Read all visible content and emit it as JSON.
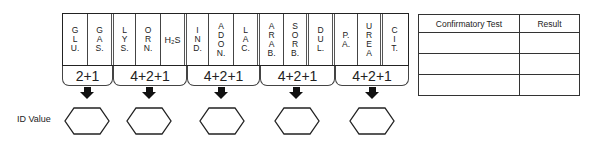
{
  "strip": {
    "cells": [
      {
        "label": [
          "G",
          "L",
          "U."
        ]
      },
      {
        "label": [
          "G",
          "A",
          "S."
        ]
      },
      {
        "label": [
          "L",
          "Y",
          "S."
        ]
      },
      {
        "label": [
          "O",
          "R",
          "N."
        ]
      },
      {
        "label": "H₂S"
      },
      {
        "label": [
          "I",
          "N",
          "D."
        ]
      },
      {
        "label": [
          "A",
          "D",
          "O",
          "N."
        ]
      },
      {
        "label": [
          "L",
          "A",
          "C."
        ]
      },
      {
        "label": [
          "A",
          "R",
          "A",
          "B."
        ]
      },
      {
        "label": [
          "S",
          "O",
          "R",
          "B."
        ]
      },
      {
        "label": [
          "D",
          "U",
          "L."
        ]
      },
      {
        "label": [
          "P.",
          "A."
        ]
      },
      {
        "label": [
          "U",
          "R",
          "E",
          "A"
        ]
      },
      {
        "label": [
          "C",
          "I",
          "T."
        ]
      }
    ],
    "groups": [
      {
        "label": "2+1"
      },
      {
        "label": "4+2+1"
      },
      {
        "label": "4+2+1"
      },
      {
        "label": "4+2+1"
      },
      {
        "label": "4+2+1"
      }
    ]
  },
  "id_value_label": "ID Value",
  "confirmatory_table": {
    "headers": [
      "Confirmatory Test",
      "Result"
    ],
    "rows": [
      [
        "",
        ""
      ],
      [
        "",
        ""
      ],
      [
        "",
        ""
      ]
    ]
  }
}
